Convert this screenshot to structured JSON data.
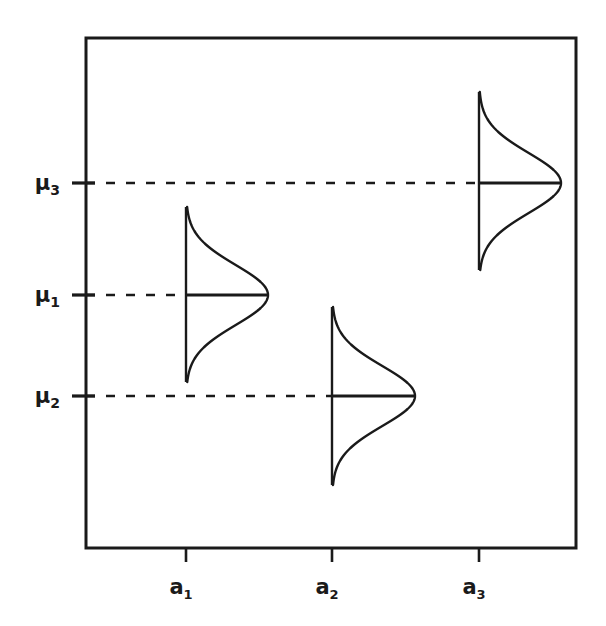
{
  "figure": {
    "title": "",
    "background_color": "#ffffff",
    "line_color": "#1a1a1a",
    "frame": {
      "left": 86,
      "top": 38,
      "right": 576,
      "bottom": 548,
      "stroke_width": 3
    }
  },
  "y_axis": {
    "label": "",
    "ticks": [
      {
        "name": "mu-3",
        "base": "μ",
        "subscript": "3",
        "y": 183
      },
      {
        "name": "mu-1",
        "base": "μ",
        "subscript": "1",
        "y": 295
      },
      {
        "name": "mu-2",
        "base": "μ",
        "subscript": "2",
        "y": 396
      }
    ]
  },
  "x_axis": {
    "label": "",
    "ticks": [
      {
        "name": "a-1",
        "base": "a",
        "subscript": "1",
        "x": 186
      },
      {
        "name": "a-2",
        "base": "a",
        "subscript": "2",
        "x": 332
      },
      {
        "name": "a-3",
        "base": "a",
        "subscript": "3",
        "x": 479
      }
    ]
  },
  "chart_data": {
    "type": "line",
    "title": "",
    "xlabel": "",
    "ylabel": "",
    "categories": [
      "a₁",
      "a₂",
      "a₃"
    ],
    "series": [
      {
        "name": "population means",
        "point_labels": [
          "μ₁",
          "μ₂",
          "μ₃"
        ],
        "values_px_y": [
          295,
          396,
          183
        ]
      }
    ],
    "distributions": [
      {
        "name": "distribution-a1",
        "level": "a₁",
        "mean_label": "μ₁",
        "axis_x": 186,
        "mean_y": 295,
        "top_y": 207,
        "bottom_y": 382,
        "peak_x": 268,
        "amplitude_px": 82,
        "sigma_px": 30
      },
      {
        "name": "distribution-a2",
        "level": "a₂",
        "mean_label": "μ₂",
        "axis_x": 332,
        "mean_y": 396,
        "top_y": 307,
        "bottom_y": 485,
        "peak_x": 415,
        "amplitude_px": 83,
        "sigma_px": 30
      },
      {
        "name": "distribution-a3",
        "level": "a₃",
        "mean_label": "μ₃",
        "axis_x": 479,
        "mean_y": 183,
        "top_y": 92,
        "bottom_y": 270,
        "peak_x": 561,
        "amplitude_px": 82,
        "sigma_px": 30
      }
    ],
    "dashed_lines": [
      {
        "name": "dashed-mu3",
        "label": "μ₃",
        "from_x": 86,
        "to_x": 479,
        "y": 183
      },
      {
        "name": "dashed-mu1",
        "label": "μ₁",
        "from_x": 86,
        "to_x": 186,
        "y": 295
      },
      {
        "name": "dashed-mu2",
        "label": "μ₂",
        "from_x": 86,
        "to_x": 332,
        "y": 396
      }
    ],
    "grid": false,
    "legend": "none"
  }
}
